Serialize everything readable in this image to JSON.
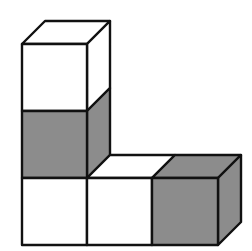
{
  "diagram": {
    "colors": {
      "white": "#ffffff",
      "gray": "#8c8c8c",
      "edge": "#111111"
    },
    "cubes": [
      {
        "id": "top",
        "column": 0,
        "row": 2,
        "color": "white"
      },
      {
        "id": "middle",
        "column": 0,
        "row": 1,
        "color": "gray"
      },
      {
        "id": "bottom-left",
        "column": 0,
        "row": 0,
        "color": "white"
      },
      {
        "id": "bottom-center",
        "column": 1,
        "row": 0,
        "color": "white"
      },
      {
        "id": "bottom-right",
        "column": 2,
        "row": 0,
        "color": "gray"
      }
    ]
  }
}
